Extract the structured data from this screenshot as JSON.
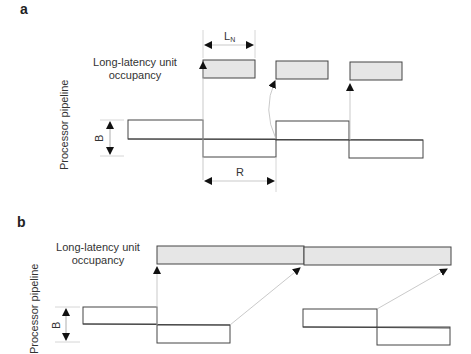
{
  "panels": [
    {
      "id": "a",
      "label": "a",
      "unit_label_line1": "Long-latency unit",
      "unit_label_line2": "occupancy",
      "pipeline_label": "Processor pipeline",
      "b_label": "B",
      "ln_label": "L",
      "ln_sub": "N",
      "r_label": "R"
    },
    {
      "id": "b",
      "label": "b",
      "unit_label_line1": "Long-latency unit",
      "unit_label_line2": "occupancy",
      "pipeline_label": "Processor pipeline",
      "b_label": "B"
    }
  ],
  "colors": {
    "stroke": "#444444",
    "fill_occupancy": "#e6e6e6",
    "connector": "#bbbbbb"
  }
}
